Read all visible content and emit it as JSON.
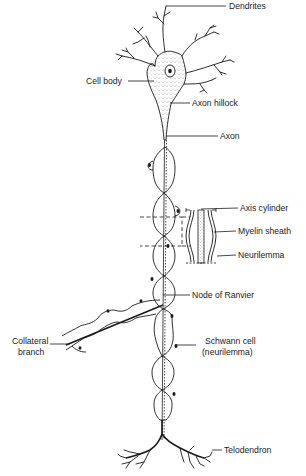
{
  "diagram": {
    "labels": {
      "dendrites": "Dendrites",
      "cell_body": "Cell body",
      "axon_hillock": "Axon hillock",
      "axon": "Axon",
      "axis_cylinder": "Axis cylinder",
      "myelin_sheath": "Myelin sheath",
      "neurilemma": "Neurilemma",
      "node_of_ranvier": "Node of Ranvier",
      "collateral_branch_line1": "Collateral",
      "collateral_branch_line2": "branch",
      "schwann_cell_line1": "Schwann cell",
      "schwann_cell_line2": "(neurilemma)",
      "telodendron": "Telodendron"
    },
    "colors": {
      "ink": "#1a1a1a",
      "background": "#ffffff"
    }
  }
}
